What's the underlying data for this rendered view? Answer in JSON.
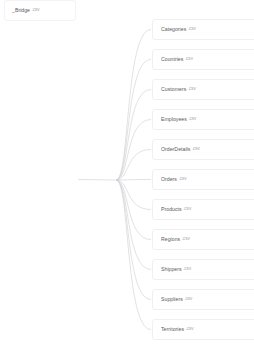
{
  "diagram": {
    "type": "lineage-tree",
    "orientation": "left-to-right",
    "background_color": "#ffffff",
    "edge_color": "#cfcfd4",
    "node_border_color": "#f0f0f1",
    "label_color": "#5a5a5e",
    "extension_color": "#a8a8ad",
    "root": {
      "name": "_Bridge",
      "extension": ".csv",
      "x": 4,
      "y": 169
    },
    "leaves": [
      {
        "name": "Categories",
        "extension": ".csv",
        "y": 19
      },
      {
        "name": "Countries",
        "extension": ".csv",
        "y": 49
      },
      {
        "name": "Customers",
        "extension": ".csv",
        "y": 79
      },
      {
        "name": "Employees",
        "extension": ".csv",
        "y": 109
      },
      {
        "name": "OrderDetails",
        "extension": ".csv",
        "y": 139
      },
      {
        "name": "Orders",
        "extension": ".csv",
        "y": 169
      },
      {
        "name": "Products",
        "extension": ".csv",
        "y": 199
      },
      {
        "name": "Regions",
        "extension": ".csv",
        "y": 229
      },
      {
        "name": "Shippers",
        "extension": ".csv",
        "y": 259
      },
      {
        "name": "Suppliers",
        "extension": ".csv",
        "y": 289
      },
      {
        "name": "Territories",
        "extension": ".csv",
        "y": 319
      }
    ],
    "hub": {
      "x": 116,
      "y": 180
    }
  }
}
